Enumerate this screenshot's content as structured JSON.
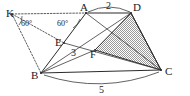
{
  "figure": {
    "width": 190,
    "height": 96,
    "background_color": "#ffffff",
    "line_color": "#2b2b2b",
    "shade_fill_color": "#b8b8b8",
    "shade_outline_color": "#2b2b2b"
  },
  "vertices": [
    {
      "id": "K",
      "label": "K",
      "x": 12,
      "y": 14,
      "label_x": 6,
      "label_y": 17
    },
    {
      "id": "A",
      "label": "A",
      "x": 86,
      "y": 13,
      "label_x": 80,
      "label_y": 11
    },
    {
      "id": "D",
      "label": "D",
      "x": 131,
      "y": 13,
      "label_x": 133,
      "label_y": 11
    },
    {
      "id": "E",
      "label": "E",
      "x": 64,
      "y": 43,
      "label_x": 55,
      "label_y": 44
    },
    {
      "id": "F",
      "label": "F",
      "x": 95,
      "y": 50,
      "label_x": 90,
      "label_y": 57
    },
    {
      "id": "B",
      "label": "B",
      "x": 41,
      "y": 73,
      "label_x": 32,
      "label_y": 78
    },
    {
      "id": "C",
      "label": "C",
      "x": 161,
      "y": 70,
      "label_x": 165,
      "label_y": 74
    }
  ],
  "measure_labels": [
    {
      "id": "len-ad",
      "text": "2",
      "x": 109,
      "y": 8
    },
    {
      "id": "len-eb",
      "text": "3",
      "x": 73,
      "y": 54
    },
    {
      "id": "len-bc",
      "text": "5",
      "x": 101,
      "y": 92
    }
  ],
  "angle_labels": [
    {
      "id": "angle-k",
      "text": "60°",
      "x": 25,
      "y": 24
    },
    {
      "id": "angle-a",
      "text": "60°",
      "x": 61,
      "y": 24
    }
  ],
  "segments": [
    {
      "id": "seg-AD",
      "from": "A",
      "to": "D",
      "style": "solid"
    },
    {
      "id": "seg-AB",
      "from": "A",
      "to": "B",
      "style": "solid"
    },
    {
      "id": "seg-BC",
      "from": "B",
      "to": "C",
      "style": "solid"
    },
    {
      "id": "seg-DC",
      "from": "D",
      "to": "C",
      "style": "solid"
    },
    {
      "id": "seg-AC",
      "from": "A",
      "to": "C",
      "style": "thin"
    },
    {
      "id": "seg-BD",
      "from": "B",
      "to": "D",
      "style": "thin"
    },
    {
      "id": "seg-EC",
      "from": "E",
      "to": "C",
      "style": "thin"
    },
    {
      "id": "seg-BF",
      "from": "B",
      "to": "F",
      "style": "thin"
    },
    {
      "id": "seg-KA",
      "from": "K",
      "to": "A",
      "style": "dotted"
    },
    {
      "id": "seg-KE",
      "from": "K",
      "to": "E",
      "style": "dotted"
    },
    {
      "id": "seg-KB",
      "from": "K",
      "to": "B",
      "style": "dotted"
    }
  ],
  "shaded_region": {
    "id": "triangle-DFC",
    "vertices": [
      "D",
      "F",
      "C"
    ],
    "description": "hatched/shaded triangle"
  },
  "arcs": [
    {
      "id": "arc-ad-top",
      "label": "2",
      "above": true
    },
    {
      "id": "arc-bc-bottom",
      "label": "5",
      "above": false
    }
  ]
}
